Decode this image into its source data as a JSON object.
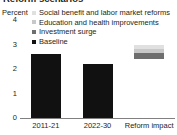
{
  "title": "Reform scenarios",
  "chart_data": {
    "type": "bar",
    "title": "Reform scenarios",
    "xlabel": "",
    "ylabel": "Percent",
    "ylim": [
      0,
      4
    ],
    "yticks": [
      "0",
      "1",
      "2",
      "3",
      "4"
    ],
    "grid": false,
    "legend_position": "top-right",
    "categories": [
      "2011-21",
      "2022-30",
      "Reform impact"
    ],
    "series": [
      {
        "name": "Social benefit and labor market reforms",
        "color": "#e0e0e0",
        "values": [
          0,
          0,
          0.2
        ]
      },
      {
        "name": "Education and health improvements",
        "color": "#c8c8c8",
        "values": [
          0,
          0,
          0.15
        ]
      },
      {
        "name": "Investment surge",
        "color": "#6e6e6e",
        "values": [
          0,
          0,
          0.25
        ]
      },
      {
        "name": "Baseline",
        "color": "#111111",
        "values": [
          2.6,
          2.2,
          0
        ]
      }
    ],
    "bars": [
      {
        "category": "2011-21",
        "base": 0,
        "segments": [
          {
            "series": "Baseline",
            "value": 2.6,
            "color": "#111111"
          }
        ]
      },
      {
        "category": "2022-30",
        "base": 0,
        "segments": [
          {
            "series": "Baseline",
            "value": 2.2,
            "color": "#111111"
          }
        ]
      },
      {
        "category": "Reform impact",
        "base": 2.4,
        "segments": [
          {
            "series": "Investment surge",
            "value": 0.25,
            "color": "#6e6e6e"
          },
          {
            "series": "Education and health improvements",
            "value": 0.15,
            "color": "#c8c8c8"
          },
          {
            "series": "Social benefit and labor market reforms",
            "value": 0.2,
            "color": "#e0e0e0"
          }
        ]
      }
    ]
  },
  "axis": {
    "y_title": "Percent",
    "ticks": [
      {
        "label": "4",
        "value": 4
      },
      {
        "label": "3",
        "value": 3
      },
      {
        "label": "2",
        "value": 2
      },
      {
        "label": "1",
        "value": 1
      },
      {
        "label": "0",
        "value": 0
      }
    ]
  },
  "legend": {
    "items": [
      {
        "label": "Social benefit and labor market reforms",
        "color": "#e0e0e0"
      },
      {
        "label": "Education and health improvements",
        "color": "#c8c8c8"
      },
      {
        "label": "Investment surge",
        "color": "#6e6e6e"
      },
      {
        "label": "Baseline",
        "color": "#111111"
      }
    ]
  },
  "categories": [
    {
      "label": "2011-21"
    },
    {
      "label": "2022-30"
    },
    {
      "label": "Reform impact"
    }
  ]
}
